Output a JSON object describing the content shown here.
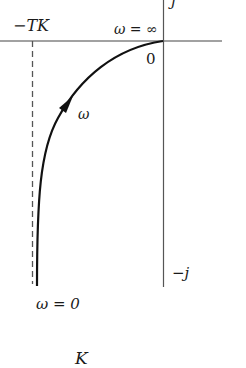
{
  "diagram": {
    "type": "nyquist-plot",
    "axes": {
      "imag_positive_label": "j",
      "imag_negative_label": "−j",
      "origin_label": "0"
    },
    "asymptote_label": "−TK",
    "curve": {
      "start_label": "ω = 0",
      "end_label": "ω = ∞",
      "direction_label": "ω"
    },
    "footer": {
      "symbol": "K"
    },
    "colors": {
      "axis": "#444444",
      "curve": "#111111",
      "asymptote": "#555555",
      "text": "#1a1a1a"
    }
  }
}
